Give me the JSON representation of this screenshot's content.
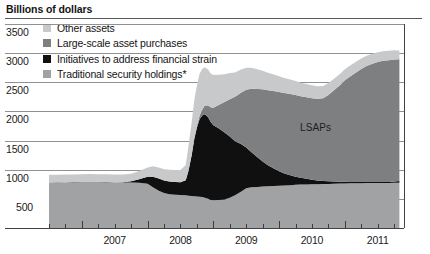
{
  "title": "Billions of dollars",
  "legend": [
    {
      "label": "Other assets",
      "color": "#c8c9ca"
    },
    {
      "label": "Large-scale asset purchases",
      "color": "#7d7f81"
    },
    {
      "label": "Initiatives to address financial strain",
      "color": "#101010"
    },
    {
      "label": "Traditional security holdings*",
      "color": "#a0a2a4"
    }
  ],
  "annotations": [
    {
      "text": "LSAPs",
      "x": 300,
      "y": 122
    }
  ],
  "axes": {
    "y_ticks": [
      "3500",
      "3000",
      "2500",
      "2000",
      "1500",
      "1000",
      "500"
    ],
    "x_ticks": [
      "2007",
      "2008",
      "2009",
      "2010",
      "2011"
    ]
  },
  "chart_data": {
    "type": "area",
    "title": "Billions of dollars",
    "xlabel": "",
    "ylabel": "Billions of dollars",
    "ylim": [
      0,
      3500
    ],
    "xlim": [
      2006.5,
      2011.9
    ],
    "grid": true,
    "stacked": true,
    "legend_position": "top-left",
    "x": [
      2006.5,
      2006.62,
      2006.75,
      2006.87,
      2007.0,
      2007.12,
      2007.25,
      2007.37,
      2007.5,
      2007.62,
      2007.75,
      2007.87,
      2008.0,
      2008.08,
      2008.17,
      2008.25,
      2008.33,
      2008.42,
      2008.5,
      2008.58,
      2008.62,
      2008.67,
      2008.71,
      2008.75,
      2008.79,
      2008.83,
      2008.87,
      2008.92,
      2008.96,
      2009.0,
      2009.08,
      2009.17,
      2009.25,
      2009.33,
      2009.42,
      2009.5,
      2009.58,
      2009.67,
      2009.75,
      2009.83,
      2009.92,
      2010.0,
      2010.08,
      2010.17,
      2010.25,
      2010.33,
      2010.42,
      2010.5,
      2010.58,
      2010.67,
      2010.75,
      2010.83,
      2010.92,
      2011.0,
      2011.08,
      2011.17,
      2011.25,
      2011.33,
      2011.42,
      2011.5,
      2011.58,
      2011.67,
      2011.75,
      2011.83
    ],
    "series": [
      {
        "name": "Traditional security holdings*",
        "color": "#a0a2a4",
        "values": [
          780,
          782,
          784,
          786,
          788,
          790,
          788,
          786,
          784,
          782,
          780,
          778,
          760,
          700,
          640,
          600,
          580,
          570,
          565,
          560,
          555,
          550,
          545,
          540,
          535,
          530,
          520,
          500,
          480,
          475,
          480,
          490,
          520,
          560,
          620,
          680,
          700,
          705,
          710,
          715,
          720,
          725,
          730,
          735,
          740,
          745,
          748,
          750,
          752,
          755,
          757,
          760,
          762,
          765,
          766,
          768,
          769,
          770,
          771,
          772,
          773,
          774,
          775,
          776
        ]
      },
      {
        "name": "Initiatives to address financial strain",
        "color": "#101010",
        "values": [
          2,
          2,
          2,
          2,
          2,
          2,
          2,
          2,
          2,
          5,
          20,
          60,
          120,
          180,
          210,
          215,
          218,
          220,
          222,
          260,
          420,
          700,
          980,
          1180,
          1330,
          1400,
          1430,
          1400,
          1340,
          1290,
          1230,
          1150,
          1050,
          930,
          820,
          700,
          600,
          510,
          430,
          360,
          300,
          250,
          205,
          170,
          140,
          115,
          95,
          78,
          64,
          53,
          44,
          37,
          32,
          28,
          25,
          22,
          20,
          18,
          17,
          16,
          15,
          14,
          22,
          30
        ]
      },
      {
        "name": "Large-scale asset purchases",
        "color": "#7d7f81",
        "values": [
          0,
          0,
          0,
          0,
          0,
          0,
          0,
          0,
          0,
          0,
          0,
          0,
          0,
          0,
          0,
          0,
          0,
          0,
          0,
          0,
          0,
          0,
          10,
          30,
          60,
          100,
          150,
          200,
          250,
          300,
          400,
          520,
          640,
          760,
          880,
          990,
          1090,
          1170,
          1240,
          1290,
          1330,
          1360,
          1380,
          1395,
          1400,
          1400,
          1400,
          1400,
          1400,
          1420,
          1480,
          1560,
          1650,
          1740,
          1810,
          1880,
          1940,
          1990,
          2030,
          2060,
          2080,
          2090,
          2095,
          2090
        ]
      },
      {
        "name": "Other assets",
        "color": "#c8c9ca",
        "values": [
          130,
          130,
          132,
          132,
          134,
          134,
          133,
          133,
          132,
          132,
          131,
          140,
          160,
          180,
          190,
          195,
          200,
          205,
          210,
          260,
          420,
          560,
          660,
          700,
          720,
          700,
          660,
          620,
          580,
          560,
          520,
          480,
          450,
          420,
          400,
          380,
          360,
          340,
          320,
          300,
          285,
          270,
          258,
          248,
          240,
          232,
          226,
          220,
          215,
          210,
          205,
          200,
          196,
          192,
          188,
          184,
          180,
          176,
          172,
          168,
          165,
          162,
          158,
          150
        ]
      }
    ]
  }
}
